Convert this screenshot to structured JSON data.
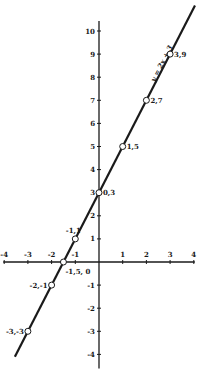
{
  "chart_data": {
    "type": "line",
    "title": "",
    "xlabel": "",
    "ylabel": "",
    "xlim": [
      -4,
      4
    ],
    "ylim": [
      -4,
      10
    ],
    "grid": false,
    "x_ticks": [
      -4,
      -3,
      -2,
      -1,
      1,
      2,
      3,
      4
    ],
    "y_ticks": [
      -4,
      -3,
      -2,
      -1,
      1,
      2,
      3,
      4,
      5,
      6,
      7,
      8,
      9,
      10
    ],
    "series": [
      {
        "name": "y = 2x + 3",
        "equation": "y = 2x + 3",
        "slope": 2,
        "intercept": 3,
        "line_extent": {
          "x_start": -3.55,
          "x_end": 4.05
        }
      }
    ],
    "points": [
      {
        "x": -3,
        "y": -3,
        "label": "-3,-3"
      },
      {
        "x": -2,
        "y": -1,
        "label": "-2,-1"
      },
      {
        "x": -1.5,
        "y": 0,
        "label": "-1,5, 0"
      },
      {
        "x": -1,
        "y": 1,
        "label": "-1,1"
      },
      {
        "x": 0,
        "y": 3,
        "label": "0,3"
      },
      {
        "x": 1,
        "y": 5,
        "label": "1,5"
      },
      {
        "x": 2,
        "y": 7,
        "label": "2,7"
      },
      {
        "x": 3,
        "y": 9,
        "label": "3,9"
      }
    ],
    "annotations": [
      {
        "text": "y = 2x + 3",
        "position": "along line near (2.5, 8)"
      }
    ],
    "line_color": "#1a1a1a",
    "background_color": "#ffffff"
  }
}
